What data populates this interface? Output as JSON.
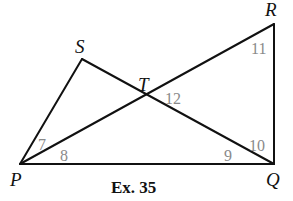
{
  "diagram": {
    "caption": "Ex. 35",
    "vertices": {
      "P": {
        "label": "P",
        "x": 20,
        "y": 164
      },
      "Q": {
        "label": "Q",
        "x": 274,
        "y": 164
      },
      "R": {
        "label": "R",
        "x": 274,
        "y": 24
      },
      "S": {
        "label": "S",
        "x": 82,
        "y": 59
      },
      "T": {
        "label": "T",
        "x": 147,
        "y": 94
      }
    },
    "segments": [
      "PQ",
      "QR",
      "PR",
      "PS",
      "SQ"
    ],
    "angles": [
      {
        "label": "7",
        "at": "P",
        "between": "PS-PR"
      },
      {
        "label": "8",
        "at": "P",
        "between": "PR-PQ"
      },
      {
        "label": "9",
        "at": "Q",
        "between": "QP-QS"
      },
      {
        "label": "10",
        "at": "Q",
        "between": "QS-QR"
      },
      {
        "label": "11",
        "at": "R",
        "between": "RP-RQ"
      },
      {
        "label": "12",
        "at": "T",
        "between": "TR-TQ"
      }
    ],
    "colors": {
      "lines": "#111111",
      "angle_labels": "#8a8a8a",
      "vertex_labels": "#111111"
    }
  }
}
